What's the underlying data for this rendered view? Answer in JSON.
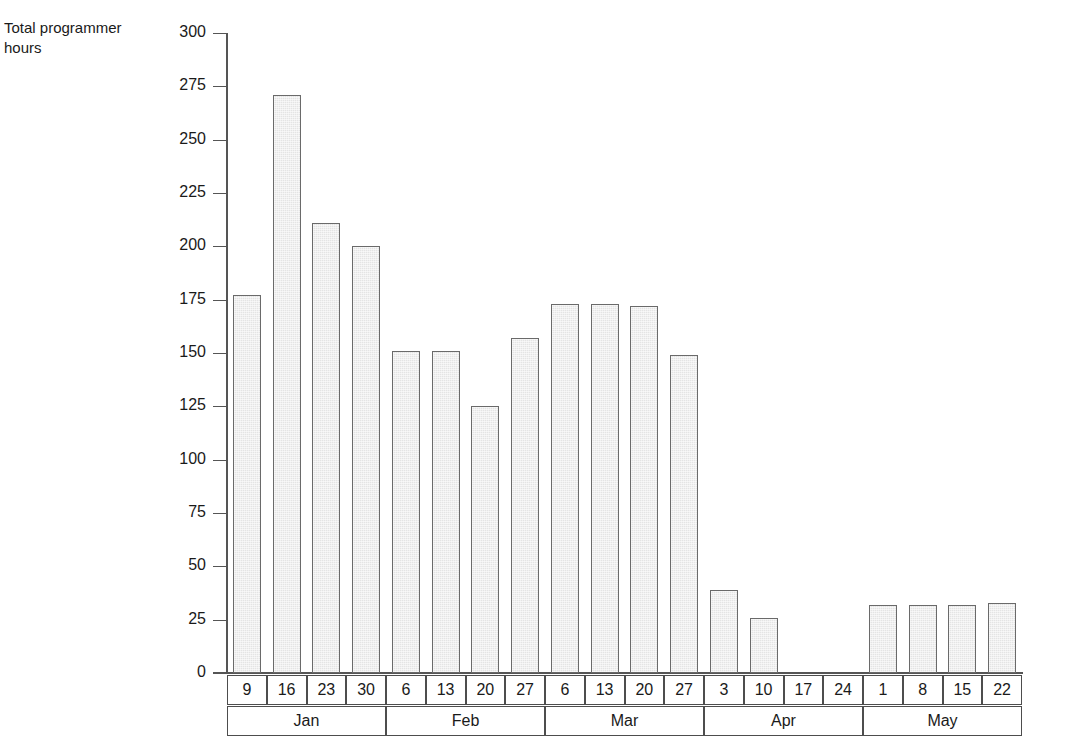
{
  "chart_data": {
    "type": "bar",
    "title": "",
    "xlabel": "",
    "ylabel": "Total programmer\nhours",
    "ylim": [
      0,
      300
    ],
    "ytick_step": 25,
    "yticks": [
      300,
      275,
      250,
      225,
      200,
      175,
      150,
      125,
      100,
      75,
      50,
      25,
      0
    ],
    "grid": false,
    "legend": null,
    "categories": [
      "9",
      "16",
      "23",
      "30",
      "6",
      "13",
      "20",
      "27",
      "6",
      "13",
      "20",
      "27",
      "3",
      "10",
      "17",
      "24",
      "1",
      "8",
      "15",
      "22"
    ],
    "values": [
      177,
      271,
      211,
      200,
      151,
      151,
      125,
      157,
      173,
      173,
      172,
      149,
      39,
      26,
      0,
      0,
      32,
      32,
      32,
      33
    ],
    "groups": [
      {
        "label": "Jan",
        "days": [
          "9",
          "16",
          "23",
          "30"
        ],
        "values": [
          177,
          271,
          211,
          200
        ]
      },
      {
        "label": "Feb",
        "days": [
          "6",
          "13",
          "20",
          "27"
        ],
        "values": [
          151,
          151,
          125,
          157
        ]
      },
      {
        "label": "Mar",
        "days": [
          "6",
          "13",
          "20",
          "27"
        ],
        "values": [
          173,
          173,
          172,
          149
        ]
      },
      {
        "label": "Apr",
        "days": [
          "3",
          "10",
          "17",
          "24"
        ],
        "values": [
          39,
          26,
          0,
          0
        ]
      },
      {
        "label": "May",
        "days": [
          "1",
          "8",
          "15",
          "22"
        ],
        "values": [
          32,
          32,
          32,
          33
        ]
      }
    ],
    "colors": {
      "bar_fill": "#e4e4e4",
      "bar_border": "#6a6a6a",
      "axis": "#555555",
      "text": "#1a1a1a",
      "table_border": "#4d4d4d",
      "background": "#ffffff"
    }
  }
}
